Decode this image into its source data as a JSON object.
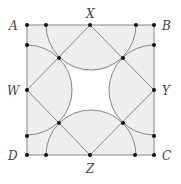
{
  "diagram": {
    "labels": {
      "A": "A",
      "B": "B",
      "C": "C",
      "D": "D",
      "W": "W",
      "X": "X",
      "Y": "Y",
      "Z": "Z"
    },
    "colors": {
      "line": "#777777",
      "fill": "#eeeeee",
      "dot": "#111111",
      "background": "#ffffff"
    },
    "square": {
      "x": 27,
      "y": 25,
      "size": 128
    },
    "semicircle_radius": 45
  }
}
